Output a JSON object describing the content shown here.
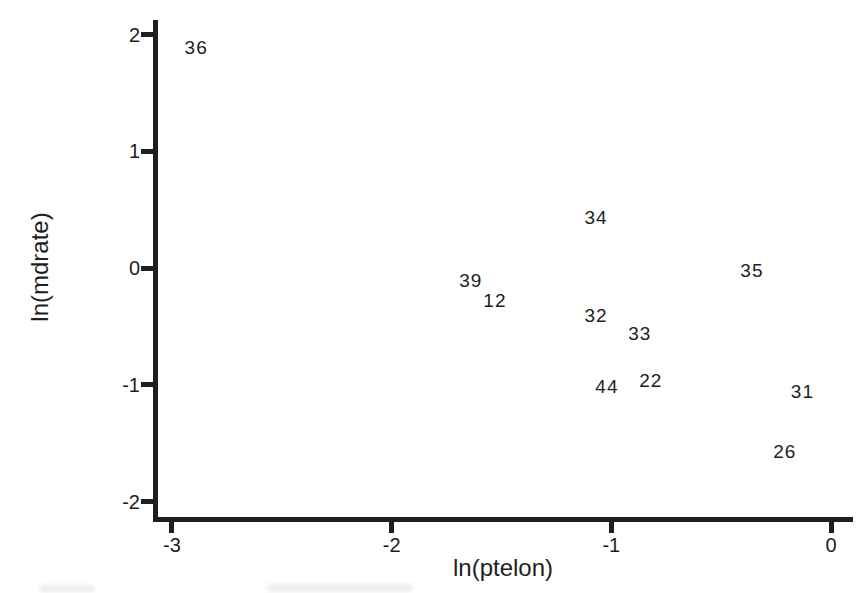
{
  "colors": {
    "ink": "#1e1e1e",
    "background": "#ffffff"
  },
  "chart_data": {
    "type": "scatter",
    "title": "",
    "xlabel": "ln(ptelon)",
    "ylabel": "ln(mdrate)",
    "xlim": [
      -3.1,
      0.1
    ],
    "ylim": [
      -2.2,
      2.15
    ],
    "x_ticks": [
      -3,
      -2,
      -1,
      0
    ],
    "y_ticks": [
      2,
      1,
      0,
      -1,
      -2
    ],
    "grid": false,
    "legend": "none",
    "marker_style": "case-number-text-labels",
    "points": [
      {
        "label": "36",
        "x": -2.89,
        "y": 1.89
      },
      {
        "label": "34",
        "x": -1.07,
        "y": 0.44
      },
      {
        "label": "39",
        "x": -1.64,
        "y": -0.1
      },
      {
        "label": "12",
        "x": -1.53,
        "y": -0.27
      },
      {
        "label": "35",
        "x": -0.36,
        "y": -0.02
      },
      {
        "label": "32",
        "x": -1.07,
        "y": -0.4
      },
      {
        "label": "33",
        "x": -0.87,
        "y": -0.56
      },
      {
        "label": "44",
        "x": -1.02,
        "y": -1.01
      },
      {
        "label": "22",
        "x": -0.82,
        "y": -0.96
      },
      {
        "label": "31",
        "x": -0.13,
        "y": -1.05
      },
      {
        "label": "26",
        "x": -0.21,
        "y": -1.57
      }
    ]
  }
}
